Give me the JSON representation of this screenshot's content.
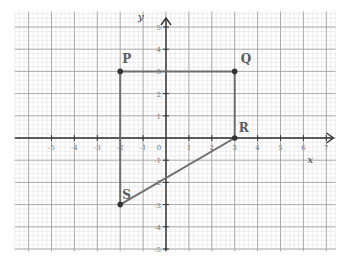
{
  "figure": {
    "type": "coordinate-grid-diagram",
    "axes": {
      "x_label": "x",
      "y_label": "y",
      "origin_label": "0",
      "x_ticks": [
        -5,
        -4,
        -3,
        -2,
        -1,
        1,
        2,
        3,
        4,
        5,
        6,
        7
      ],
      "y_ticks": [
        5,
        4,
        3,
        2,
        1,
        -1,
        -2,
        -3,
        -4,
        -5
      ],
      "x_range": [
        -6.6,
        7.4
      ],
      "y_range": [
        -5.1,
        5.7
      ]
    },
    "points": [
      {
        "label": "P",
        "x": -2,
        "y": 3
      },
      {
        "label": "Q",
        "x": 3,
        "y": 3
      },
      {
        "label": "R",
        "x": 3,
        "y": 0
      },
      {
        "label": "S",
        "x": -2,
        "y": -3
      }
    ],
    "segments": [
      [
        "P",
        "Q"
      ],
      [
        "Q",
        "R"
      ],
      [
        "R",
        "S"
      ],
      [
        "S",
        "P"
      ]
    ],
    "shape": "quadrilateral PQRS",
    "colors": {
      "background": "#ffffff",
      "minor_grid": "#e3e3e3",
      "major_grid": "#9a9a9a",
      "axis": "#333333",
      "shape_line": "#6e6e6e",
      "point": "#333333",
      "label": "#5a5a5a",
      "tick_text": "#777777"
    }
  }
}
